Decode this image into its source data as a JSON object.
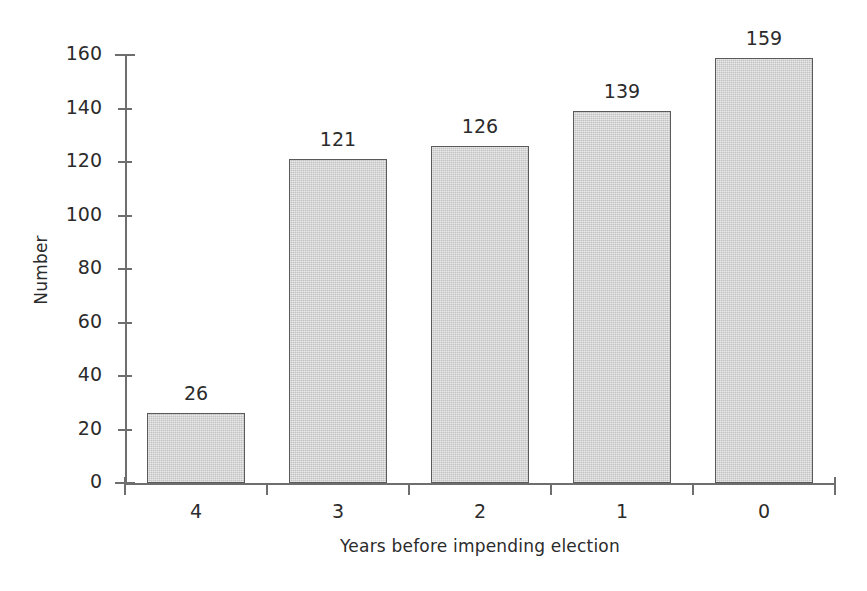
{
  "chart_data": {
    "type": "bar",
    "title": "",
    "subtitle": "",
    "xlabel": "Years before impending election",
    "ylabel": "Number",
    "categories": [
      "4",
      "3",
      "2",
      "1",
      "0"
    ],
    "values": [
      26,
      121,
      126,
      139,
      159
    ],
    "data_labels": [
      "26",
      "121",
      "126",
      "139",
      "159"
    ],
    "ylim": [
      0,
      160
    ],
    "ytick_values": [
      0,
      20,
      40,
      60,
      80,
      100,
      120,
      140,
      160
    ],
    "ytick_labels": [
      "0",
      "20",
      "40",
      "60",
      "80",
      "100",
      "120",
      "140",
      "160"
    ],
    "grid": false,
    "legend": null,
    "legend_position": "none",
    "annotations": [],
    "series": [
      {
        "name": "Number",
        "values": [
          26,
          121,
          126,
          139,
          159
        ]
      }
    ],
    "colors": {
      "bar_fill": "#d4d4d4",
      "bar_border": "#5a5a5a",
      "axis": "#6e6e6e",
      "text": "#2b2b2b",
      "background": "#ffffff"
    }
  }
}
